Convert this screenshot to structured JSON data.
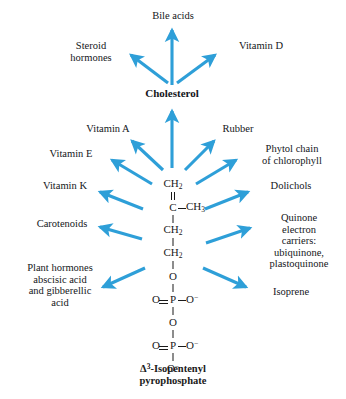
{
  "diagram": {
    "accent_color": "#2e9fd8",
    "text_color": "#14161a",
    "background_color": "#ffffff",
    "center_label_line1": "Δ3-Isopentenyl",
    "center_label_line2": "pyrophosphate",
    "center_label_delta": "Δ",
    "center_label_superscript": "3",
    "center_label_rest": "-Isopentenyl",
    "hub_label": "Cholesterol"
  },
  "structure": {
    "name": "isopentenyl-pyrophosphate",
    "rows": [
      {
        "type": "atom",
        "center": "CH2",
        "sub": "2"
      },
      {
        "type": "bond",
        "order": "double"
      },
      {
        "type": "atom",
        "center": "C",
        "right": "CH3",
        "right_sub": "3",
        "bond": "single-right"
      },
      {
        "type": "bond",
        "order": "single"
      },
      {
        "type": "atom",
        "center": "CH2",
        "sub": "2"
      },
      {
        "type": "bond",
        "order": "single"
      },
      {
        "type": "atom",
        "center": "CH2",
        "sub": "2"
      },
      {
        "type": "bond",
        "order": "single"
      },
      {
        "type": "atom",
        "center": "O"
      },
      {
        "type": "bond",
        "order": "single"
      },
      {
        "type": "atom",
        "center": "P",
        "left": "O",
        "right": "O−",
        "bond": "double-left-single-right"
      },
      {
        "type": "bond",
        "order": "single"
      },
      {
        "type": "atom",
        "center": "O"
      },
      {
        "type": "bond",
        "order": "single"
      },
      {
        "type": "atom",
        "center": "P",
        "left": "O",
        "right": "O−",
        "bond": "double-left-single-right"
      },
      {
        "type": "bond",
        "order": "single"
      },
      {
        "type": "atom",
        "center": "O−"
      }
    ],
    "atoms_text": {
      "ch2": "CH",
      "ch2_sub": "2",
      "c": "C",
      "ch3": "CH",
      "ch3_sub": "3",
      "o": "O",
      "p": "P",
      "o_minus": "O",
      "o_minus_sup": "−"
    }
  },
  "products": {
    "bile_acids": "Bile acids",
    "steroid_hormones": "Steroid\nhormones",
    "vitamin_d": "Vitamin D",
    "cholesterol": "Cholesterol",
    "vitamin_a": "Vitamin A",
    "rubber": "Rubber",
    "vitamin_e": "Vitamin E",
    "phytol_chain": "Phytol chain\nof chlorophyll",
    "vitamin_k": "Vitamin K",
    "dolichols": "Dolichols",
    "carotenoids": "Carotenoids",
    "quinone_carriers": "Quinone\nelectron\ncarriers:\nubiquinone,\nplastoquinone",
    "plant_hormones": "Plant hormones\nabscisic acid\nand gibberellic\nacid",
    "isoprene": "Isoprene"
  },
  "arrows": [
    {
      "name": "arrow-to-bile-acids",
      "from": "cholesterol",
      "to": "bile_acids"
    },
    {
      "name": "arrow-to-steroid-hormones",
      "from": "cholesterol",
      "to": "steroid_hormones"
    },
    {
      "name": "arrow-to-vitamin-d",
      "from": "cholesterol",
      "to": "vitamin_d"
    },
    {
      "name": "arrow-to-cholesterol",
      "from": "ipp",
      "to": "cholesterol"
    },
    {
      "name": "arrow-to-vitamin-a",
      "from": "ipp",
      "to": "vitamin_a"
    },
    {
      "name": "arrow-to-rubber",
      "from": "ipp",
      "to": "rubber"
    },
    {
      "name": "arrow-to-vitamin-e",
      "from": "ipp",
      "to": "vitamin_e"
    },
    {
      "name": "arrow-to-phytol-chain",
      "from": "ipp",
      "to": "phytol_chain"
    },
    {
      "name": "arrow-to-vitamin-k",
      "from": "ipp",
      "to": "vitamin_k"
    },
    {
      "name": "arrow-to-dolichols",
      "from": "ipp",
      "to": "dolichols"
    },
    {
      "name": "arrow-to-carotenoids",
      "from": "ipp",
      "to": "carotenoids"
    },
    {
      "name": "arrow-to-quinone-carriers",
      "from": "ipp",
      "to": "quinone_carriers"
    },
    {
      "name": "arrow-to-plant-hormones",
      "from": "ipp",
      "to": "plant_hormones"
    },
    {
      "name": "arrow-to-isoprene",
      "from": "ipp",
      "to": "isoprene"
    }
  ]
}
